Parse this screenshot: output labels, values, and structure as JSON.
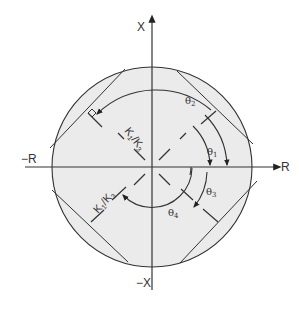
{
  "diagram": {
    "type": "polar-angle-diagram",
    "axes": {
      "vertical_positive": "X",
      "vertical_negative": "−X",
      "horizontal_positive": "R",
      "horizontal_negative": "−R"
    },
    "angle_labels": {
      "theta1": "θ",
      "theta1_sub": "1",
      "theta2": "θ",
      "theta2_sub": "2",
      "theta3": "θ",
      "theta3_sub": "3",
      "theta4": "θ",
      "theta4_sub": "4"
    },
    "ratio_labels": {
      "upper": {
        "k1": "K",
        "k1_sub": "1",
        "slash": "/",
        "k3": "K",
        "k3_sub": "3"
      },
      "lower": {
        "k1": "K",
        "k1_sub": "1",
        "slash": "/",
        "k3": "K",
        "k3_sub": "3"
      }
    },
    "colors": {
      "circle_fill": "#ebebeb",
      "stroke": "#333333",
      "background": "#ffffff"
    }
  }
}
